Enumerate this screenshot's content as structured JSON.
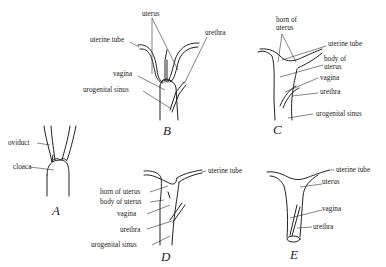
{
  "figures": {
    "A": {
      "letter": "A",
      "labels": {
        "oviduct": "oviduct",
        "cloaca": "cloaca"
      }
    },
    "B": {
      "letter": "B",
      "labels": {
        "uterus": "uterus",
        "uterine_tube": "uterine tube",
        "urethra": "urethra",
        "vagina": "vagina",
        "urogenital_sinus": "urogenital sinus"
      }
    },
    "C": {
      "letter": "C",
      "labels": {
        "horn_of_uterus_1": "horn of",
        "horn_of_uterus_2": "uterus",
        "uterine_tube": "uterine tube",
        "body_of_uterus_1": "body of",
        "body_of_uterus_2": "uterus",
        "vagina": "vagina",
        "urethra": "urethra",
        "urogenital_sinus": "urogenital sinus"
      }
    },
    "D": {
      "letter": "D",
      "labels": {
        "uterine_tube": "uterine tube",
        "horn_of_uterus": "horn of uterus",
        "body_of_uterus": "body of uterus",
        "vagina": "vagina",
        "urethra": "urethra",
        "urogenital_sinus": "urogenital sinus"
      }
    },
    "E": {
      "letter": "E",
      "labels": {
        "uterine_tube": "uterine tube",
        "uterus": "uterus",
        "vagina": "vagina",
        "urethra": "urethra"
      }
    }
  }
}
